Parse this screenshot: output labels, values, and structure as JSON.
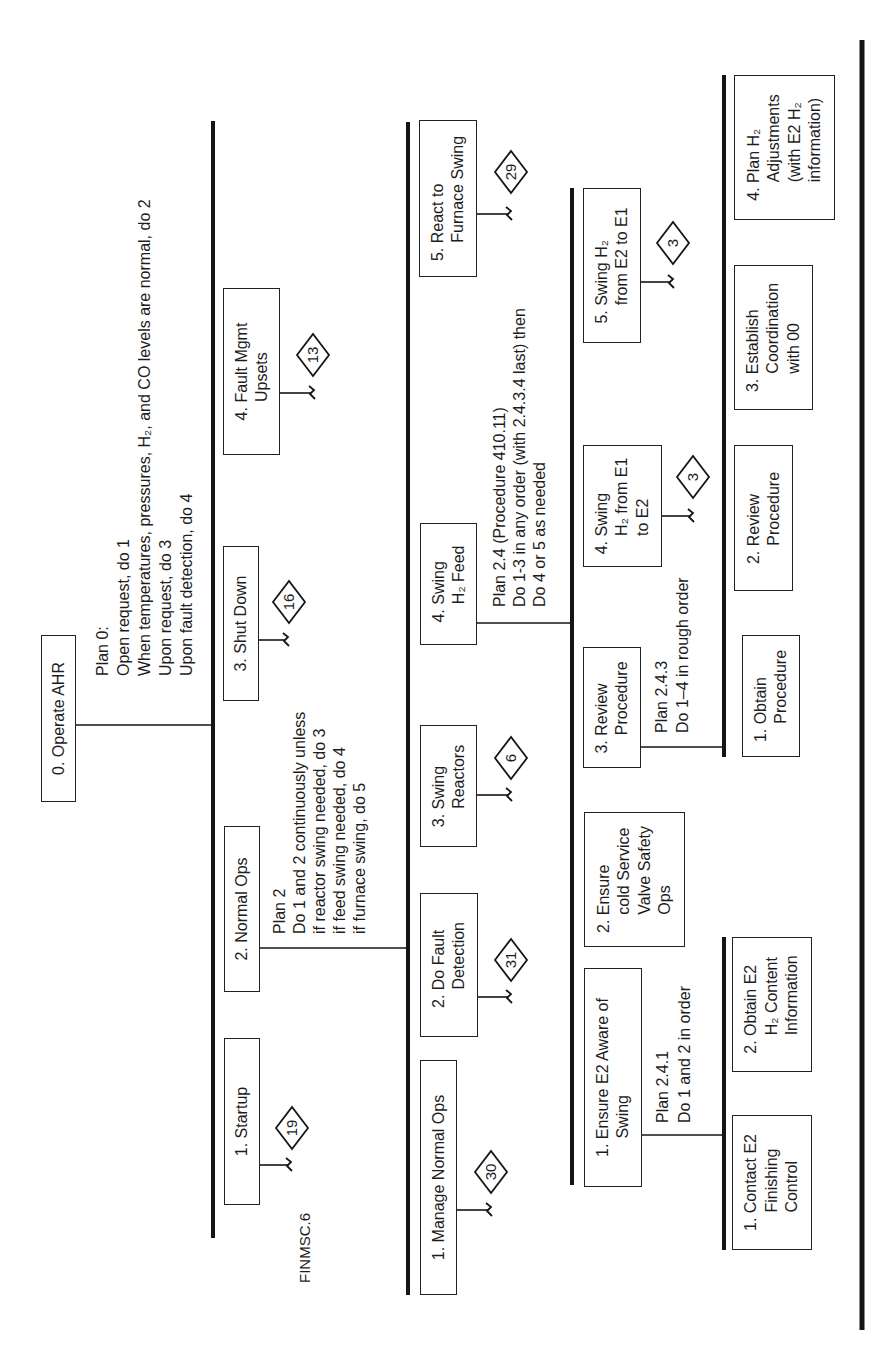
{
  "figure_label": "FINMSC.6",
  "nodes": {
    "operate_ahr": {
      "lines": [
        "0. Operate AHR"
      ]
    },
    "startup": {
      "lines": [
        "1.  Startup"
      ],
      "ref": "19"
    },
    "normal_ops": {
      "lines": [
        "2.  Normal Ops"
      ]
    },
    "shut_down": {
      "lines": [
        "3.  Shut Down"
      ],
      "ref": "16"
    },
    "fault_mgmt": {
      "lines": [
        "4.  Fault Mgmt",
        "Upsets"
      ],
      "ref": "13"
    },
    "manage_normal_ops": {
      "lines": [
        "1. Manage Normal Ops"
      ],
      "ref": "30"
    },
    "do_fault_detection": {
      "lines": [
        "2. Do Fault",
        "Detection"
      ],
      "ref": "31"
    },
    "swing_reactors": {
      "lines": [
        "3. Swing",
        "Reactors"
      ],
      "ref": "6"
    },
    "swing_h2_feed": {
      "lines": [
        "4. Swing",
        "H₂ Feed"
      ]
    },
    "react_furnace_swing": {
      "lines": [
        "5. React to",
        "Furnace Swing"
      ],
      "ref": "29"
    },
    "ensure_e2_aware": {
      "lines": [
        "1. Ensure E2 Aware of",
        "Swing"
      ]
    },
    "ensure_cold_service": {
      "lines": [
        "2. Ensure",
        "cold Service",
        "Valve Safety",
        "Ops"
      ]
    },
    "review_procedure_main": {
      "lines": [
        "3. Review",
        "Procedure"
      ]
    },
    "swing_h2_e1_to_e2": {
      "lines": [
        "4. Swing",
        "H₂ from E1",
        "to E2"
      ],
      "ref": "3"
    },
    "swing_h2_e2_to_e1": {
      "lines": [
        "5. Swing H₂",
        "from E2 to E1"
      ],
      "ref": "3"
    },
    "contact_e2": {
      "lines": [
        "1. Contact E2",
        "Finishing",
        "Control"
      ]
    },
    "obtain_e2_h2": {
      "lines": [
        "2. Obtain E2",
        "H₂ Content",
        "Information"
      ]
    },
    "obtain_procedure": {
      "lines": [
        "1. Obtain",
        "Procedure"
      ]
    },
    "review_procedure": {
      "lines": [
        "2. Review",
        "Procedure"
      ]
    },
    "establish_coordination": {
      "lines": [
        "3. Establish",
        "Coordination",
        "with 00"
      ]
    },
    "plan_h2_adjustments": {
      "lines": [
        "4. Plan H₂",
        "Adjustments",
        "(with E2 H₂",
        "information)"
      ]
    }
  },
  "plans": {
    "plan_0": [
      "Plan 0:",
      "Open request, do 1",
      "When temperatures, pressures, H₂, and CO levels are normal, do 2",
      "Upon request, do 3",
      "Upon fault detection, do 4"
    ],
    "plan_2": [
      "Plan 2",
      "Do 1 and 2 continuously unless",
      "if reactor swing needed, do 3",
      "if feed swing needed, do 4",
      "if furnace swing, do 5"
    ],
    "plan_2_4": [
      "Plan 2.4 (Procedure 410.11)",
      "Do 1-3 in any order (with 2.4.3.4 last) then",
      "Do 4 or 5 as needed"
    ],
    "plan_2_4_1": [
      "Plan 2.4.1",
      "Do 1 and 2 in order"
    ],
    "plan_2_4_3": [
      "Plan 2.4.3",
      "Do 1–4 in rough order"
    ]
  }
}
